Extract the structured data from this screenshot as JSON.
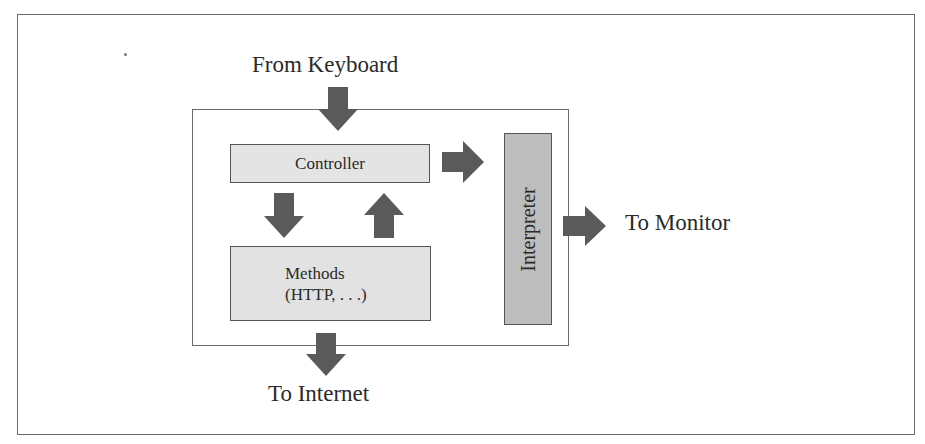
{
  "diagram": {
    "type": "block-diagram",
    "title": "",
    "inputs": {
      "keyboard_label": "From Keyboard"
    },
    "outputs": {
      "monitor_label": "To Monitor",
      "internet_label": "To Internet"
    },
    "components": {
      "controller": "Controller",
      "methods_line1": "Methods",
      "methods_line2": "(HTTP, . . .)",
      "interpreter": "Interpreter"
    },
    "edges": [
      {
        "from": "Keyboard",
        "to": "Controller",
        "direction": "down"
      },
      {
        "from": "Controller",
        "to": "Methods",
        "direction": "down"
      },
      {
        "from": "Methods",
        "to": "Controller",
        "direction": "up"
      },
      {
        "from": "Controller",
        "to": "Interpreter",
        "direction": "right"
      },
      {
        "from": "Interpreter",
        "to": "Monitor",
        "direction": "right"
      },
      {
        "from": "Methods",
        "to": "Internet",
        "direction": "down"
      }
    ],
    "colors": {
      "arrow": "#5a5a5a",
      "controller_fill": "#e4e4e4",
      "methods_fill": "#e2e2e2",
      "interpreter_fill": "#bdbdbd",
      "border": "#6a6a6a"
    }
  }
}
